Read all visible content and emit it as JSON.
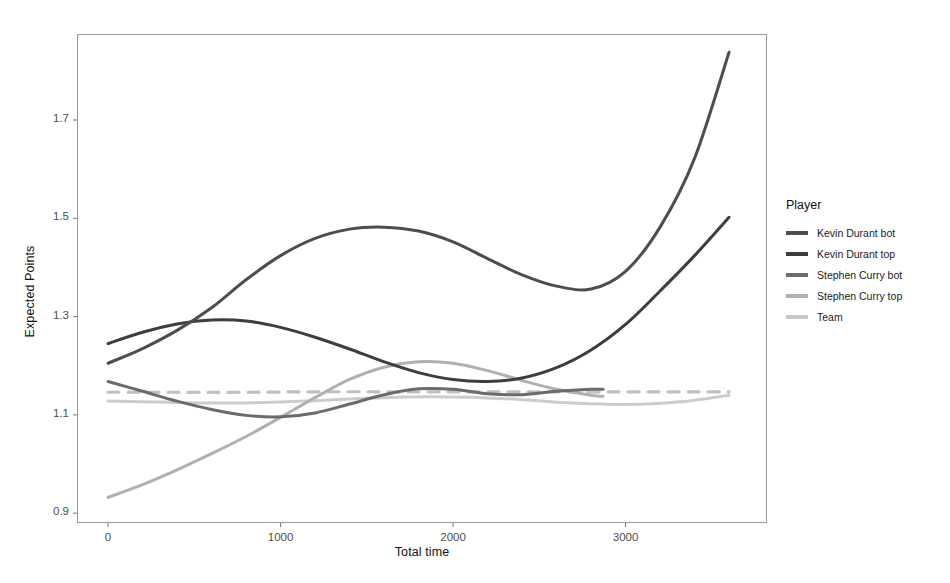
{
  "chart_data": {
    "type": "line",
    "title": "",
    "xlabel": "Total time",
    "ylabel": "Expected Points",
    "xlim": [
      -180,
      3820
    ],
    "ylim": [
      0.88,
      1.875
    ],
    "xticks": [
      0,
      1000,
      2000,
      3000
    ],
    "xtick_labels": [
      "0",
      "1000",
      "2000",
      "3000"
    ],
    "yticks": [
      0.9,
      1.1,
      1.3,
      1.5,
      1.7
    ],
    "ytick_labels": [
      "0.9",
      "1.1",
      "1.3",
      "1.5",
      "1.7"
    ],
    "grid": false,
    "legend_position": "right",
    "legend_title": "Player",
    "series": [
      {
        "name": "Kevin Durant bot",
        "color": "#4d4d4d",
        "style": "solid",
        "x": [
          0,
          200,
          400,
          600,
          800,
          1000,
          1200,
          1400,
          1600,
          1800,
          2000,
          2200,
          2400,
          2600,
          2800,
          3000,
          3200,
          3400,
          3600
        ],
        "y": [
          1.205,
          1.235,
          1.272,
          1.318,
          1.375,
          1.424,
          1.459,
          1.478,
          1.482,
          1.474,
          1.452,
          1.418,
          1.385,
          1.362,
          1.356,
          1.392,
          1.482,
          1.622,
          1.838
        ]
      },
      {
        "name": "Kevin Durant top",
        "color": "#3d3d3d",
        "style": "solid",
        "x": [
          0,
          200,
          400,
          600,
          800,
          1000,
          1200,
          1400,
          1600,
          1800,
          2000,
          2200,
          2400,
          2600,
          2800,
          3000,
          3200,
          3400,
          3600
        ],
        "y": [
          1.245,
          1.268,
          1.285,
          1.293,
          1.291,
          1.278,
          1.258,
          1.234,
          1.208,
          1.186,
          1.172,
          1.168,
          1.175,
          1.196,
          1.232,
          1.284,
          1.352,
          1.424,
          1.502
        ]
      },
      {
        "name": "Stephen Curry bot",
        "color": "#6b6b6b",
        "style": "solid",
        "x": [
          0,
          200,
          400,
          600,
          800,
          1000,
          1200,
          1400,
          1600,
          1800,
          2000,
          2200,
          2400,
          2600,
          2800,
          2870
        ],
        "y": [
          1.168,
          1.148,
          1.128,
          1.111,
          1.099,
          1.096,
          1.104,
          1.122,
          1.141,
          1.153,
          1.152,
          1.143,
          1.141,
          1.148,
          1.152,
          1.152
        ]
      },
      {
        "name": "Stephen Curry top",
        "color": "#b0b0b0",
        "style": "solid",
        "x": [
          0,
          200,
          400,
          600,
          800,
          1000,
          1200,
          1400,
          1600,
          1800,
          2000,
          2200,
          2400,
          2600,
          2800,
          2870
        ],
        "y": [
          0.932,
          0.958,
          0.988,
          1.021,
          1.056,
          1.095,
          1.135,
          1.172,
          1.197,
          1.208,
          1.205,
          1.19,
          1.17,
          1.152,
          1.14,
          1.138
        ]
      },
      {
        "name": "Team",
        "color": "#c0c0c0",
        "style": "dashed",
        "x": [
          0,
          400,
          800,
          1200,
          1600,
          2000,
          2400,
          2800,
          3200,
          3600
        ],
        "y": [
          1.146,
          1.146,
          1.146,
          1.147,
          1.147,
          1.147,
          1.147,
          1.147,
          1.147,
          1.147
        ]
      },
      {
        "name": "Team solid",
        "color": "#cccccc",
        "style": "solid",
        "x": [
          0,
          300,
          600,
          900,
          1200,
          1500,
          1800,
          2100,
          2400,
          2700,
          3000,
          3300,
          3600
        ],
        "y": [
          1.128,
          1.126,
          1.124,
          1.125,
          1.129,
          1.134,
          1.137,
          1.136,
          1.131,
          1.124,
          1.121,
          1.126,
          1.14
        ]
      }
    ],
    "legend_entries": [
      {
        "label": "Kevin Durant bot",
        "color": "#4d4d4d",
        "style": "solid"
      },
      {
        "label": "Kevin Durant top",
        "color": "#3d3d3d",
        "style": "solid"
      },
      {
        "label": "Stephen Curry bot",
        "color": "#6b6b6b",
        "style": "solid"
      },
      {
        "label": "Stephen Curry top",
        "color": "#b0b0b0",
        "style": "solid"
      },
      {
        "label": "Team",
        "color": "#c8c8c8",
        "style": "solid"
      }
    ]
  },
  "panel": {
    "border_color": "#999999",
    "background": "#ffffff"
  }
}
